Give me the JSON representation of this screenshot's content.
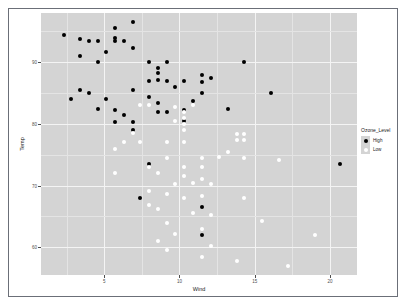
{
  "chart_data": {
    "type": "scatter",
    "title": "",
    "xlabel": "Wind",
    "ylabel": "Temp",
    "xlim": [
      0.8,
      21.8
    ],
    "ylim": [
      55.5,
      98.0
    ],
    "xticks": [
      "5",
      "10",
      "15",
      "20"
    ],
    "xtick_values": [
      5,
      10,
      15,
      20
    ],
    "yticks": [
      "90",
      "80",
      "70",
      "60"
    ],
    "ytick_values": [
      90,
      80,
      70,
      60
    ],
    "grid": true,
    "panel_background": "#d4d4d4",
    "gridline_color": "#f4f4f4",
    "legend": {
      "title": "Ozone_Level",
      "position": "right",
      "entries": [
        {
          "label": "High",
          "color": "#000000"
        },
        {
          "label": "Low",
          "color": "#ffffff"
        }
      ]
    },
    "series": [
      {
        "name": "High",
        "color": "#000000",
        "points": [
          [
            2.3,
            94.5
          ],
          [
            3.4,
            93.8
          ],
          [
            6.9,
            96.5
          ],
          [
            5.7,
            95.5
          ],
          [
            5.7,
            94.0
          ],
          [
            4.6,
            93.4
          ],
          [
            5.7,
            93.4
          ],
          [
            6.3,
            93.4
          ],
          [
            4.0,
            93.4
          ],
          [
            6.9,
            92.3
          ],
          [
            3.4,
            91.0
          ],
          [
            5.1,
            91.6
          ],
          [
            9.2,
            90.0
          ],
          [
            4.6,
            90.0
          ],
          [
            8.0,
            90.0
          ],
          [
            14.3,
            90.0
          ],
          [
            8.6,
            89.0
          ],
          [
            8.6,
            88.2
          ],
          [
            8.6,
            87.2
          ],
          [
            11.5,
            88.0
          ],
          [
            11.5,
            86.8
          ],
          [
            12.1,
            87.5
          ],
          [
            8.0,
            87.0
          ],
          [
            9.2,
            87.0
          ],
          [
            10.3,
            87.0
          ],
          [
            3.4,
            85.5
          ],
          [
            4.0,
            85.0
          ],
          [
            6.9,
            85.5
          ],
          [
            9.7,
            86.0
          ],
          [
            16.1,
            85.0
          ],
          [
            2.8,
            84.0
          ],
          [
            5.1,
            84.0
          ],
          [
            8.0,
            84.4
          ],
          [
            11.5,
            85.0
          ],
          [
            8.6,
            83.4
          ],
          [
            10.9,
            83.8
          ],
          [
            4.6,
            82.5
          ],
          [
            5.7,
            82.3
          ],
          [
            6.3,
            81.5
          ],
          [
            9.2,
            82.0
          ],
          [
            10.3,
            82.3
          ],
          [
            13.2,
            82.5
          ],
          [
            8.6,
            82.0
          ],
          [
            10.3,
            80.5
          ],
          [
            5.7,
            80.3
          ],
          [
            6.9,
            80.3
          ],
          [
            6.9,
            79.0
          ],
          [
            8.0,
            73.5
          ],
          [
            7.4,
            68.0
          ],
          [
            11.5,
            66.5
          ],
          [
            11.5,
            62.0
          ],
          [
            20.7,
            73.5
          ]
        ]
      },
      {
        "name": "Low",
        "color": "#ffffff",
        "points": [
          [
            7.4,
            83.0
          ],
          [
            8.0,
            83.0
          ],
          [
            9.7,
            82.8
          ],
          [
            10.9,
            83.0
          ],
          [
            10.3,
            82.0
          ],
          [
            10.3,
            81.0
          ],
          [
            9.7,
            80.5
          ],
          [
            10.3,
            80.0
          ],
          [
            10.3,
            79.0
          ],
          [
            6.9,
            78.5
          ],
          [
            13.8,
            78.4
          ],
          [
            14.3,
            78.4
          ],
          [
            13.8,
            77.4
          ],
          [
            14.3,
            77.4
          ],
          [
            6.3,
            77.0
          ],
          [
            7.4,
            77.0
          ],
          [
            9.2,
            77.0
          ],
          [
            10.3,
            77.0
          ],
          [
            5.7,
            76.0
          ],
          [
            13.2,
            75.5
          ],
          [
            9.2,
            74.5
          ],
          [
            11.5,
            74.4
          ],
          [
            12.6,
            74.6
          ],
          [
            14.3,
            74.5
          ],
          [
            16.6,
            74.2
          ],
          [
            8.0,
            73.0
          ],
          [
            10.3,
            73.0
          ],
          [
            11.5,
            73.0
          ],
          [
            5.7,
            72.0
          ],
          [
            8.6,
            72.0
          ],
          [
            10.3,
            71.5
          ],
          [
            11.5,
            71.0
          ],
          [
            9.7,
            70.2
          ],
          [
            10.9,
            70.4
          ],
          [
            12.1,
            70.3
          ],
          [
            8.0,
            69.2
          ],
          [
            9.2,
            68.6
          ],
          [
            10.3,
            68.0
          ],
          [
            11.5,
            68.3
          ],
          [
            14.3,
            68.0
          ],
          [
            8.0,
            66.8
          ],
          [
            8.6,
            66.2
          ],
          [
            10.9,
            65.6
          ],
          [
            12.1,
            65.3
          ],
          [
            9.2,
            64.0
          ],
          [
            15.5,
            64.2
          ],
          [
            11.5,
            63.0
          ],
          [
            9.7,
            62.2
          ],
          [
            19.0,
            62.0
          ],
          [
            8.6,
            61.0
          ],
          [
            12.1,
            60.2
          ],
          [
            9.2,
            59.5
          ],
          [
            11.5,
            58.5
          ],
          [
            13.8,
            57.8
          ],
          [
            17.2,
            57.0
          ]
        ]
      }
    ]
  }
}
